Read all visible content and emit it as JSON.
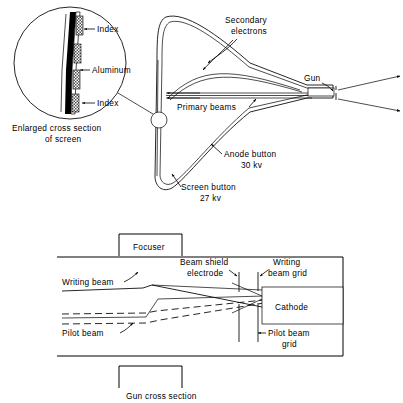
{
  "top_diagram": {
    "name": "beam-index-crt-tube",
    "callout": {
      "caption_line1": "Enlarged cross section",
      "caption_line2": "of screen",
      "layers": [
        {
          "label": "Index",
          "material": "index-stripe"
        },
        {
          "label": "Aluminum",
          "material": "aluminum-layer"
        },
        {
          "label": "Index",
          "material": "index-stripe"
        }
      ]
    },
    "labels": {
      "secondary_electrons_line1": "Secondary",
      "secondary_electrons_line2": "electrons",
      "primary_beams": "Primary beams",
      "gun": "Gun",
      "anode_button_line1": "Anode button",
      "anode_button_line2": "30 kv",
      "screen_button_line1": "Screen button",
      "screen_button_line2": "27 kv"
    }
  },
  "bottom_diagram": {
    "name": "gun-cross-section",
    "caption": "Gun cross section",
    "focuser_label": "Focuser",
    "labels": {
      "writing_beam": "Writing beam",
      "pilot_beam": "Pilot beam",
      "beam_shield_line1": "Beam shield",
      "beam_shield_line2": "electrode",
      "writing_grid_line1": "Writing",
      "writing_grid_line2": "beam grid",
      "pilot_grid_line1": "Pilot beam",
      "pilot_grid_line2": "grid",
      "cathode": "Cathode"
    }
  },
  "colors": {
    "ink": "#000000",
    "paper": "#ffffff"
  }
}
